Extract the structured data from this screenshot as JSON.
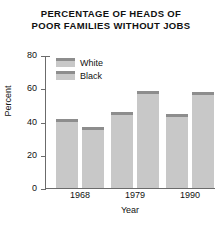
{
  "chart_data": {
    "type": "bar",
    "title": "PERCENTAGE OF HEADS OF POOR FAMILIES WITHOUT JOBS",
    "title_lines": [
      "PERCENTAGE OF HEADS OF",
      "POOR FAMILIES WITHOUT JOBS"
    ],
    "categories": [
      "1968",
      "1979",
      "1990"
    ],
    "series": [
      {
        "name": "White",
        "values": [
          42,
          46,
          45
        ],
        "color": "#c8c8c8",
        "cap_color": "#8d8d8d"
      },
      {
        "name": "Black",
        "values": [
          37,
          59,
          58
        ],
        "color": "#c8c8c8",
        "cap_color": "#8d8d8d"
      }
    ],
    "xlabel": "Year",
    "ylabel": "Percent",
    "ylim": [
      0,
      80
    ],
    "yticks": [
      0,
      20,
      40,
      60,
      80
    ],
    "ytick_labels": [
      "0",
      "20",
      "40",
      "60",
      "80"
    ],
    "grid": false,
    "legend_position": "top-left-inside",
    "axis_color": "#6b6b6b",
    "background": "#ffffff"
  },
  "legend": {
    "entries": [
      {
        "label": "White"
      },
      {
        "label": "Black"
      }
    ]
  }
}
